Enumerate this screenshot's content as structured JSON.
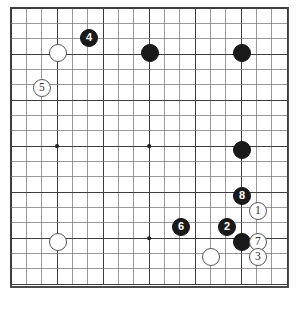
{
  "diagram": {
    "caption": "",
    "board": {
      "columns": 18,
      "rows": 18,
      "origin_x": 11,
      "origin_y": 8,
      "spacing": 15.35,
      "line_color": "#6e6e6e",
      "major_line_color": "#3c3c3c",
      "border_color": "#4a4a4a",
      "background_color": "#ffffff"
    },
    "star_points": [
      {
        "col": 3,
        "row": 9
      },
      {
        "col": 9,
        "row": 9
      },
      {
        "col": 9,
        "row": 15
      }
    ],
    "colors": {
      "black_stone": "#1a1a1a",
      "white_stone": "#ffffff",
      "white_stone_border": "#585858",
      "black_label": "#ffffff",
      "white_label": "#303030"
    },
    "legend": {
      "black_name": "Black",
      "white_name": "White"
    },
    "stones": [
      {
        "id": "w-a",
        "color": "white",
        "label": "",
        "col": 3,
        "row": 3,
        "cx": 58,
        "cy": 53
      },
      {
        "id": "b-4",
        "color": "black",
        "label": "4",
        "col": 5,
        "row": 2,
        "cx": 89,
        "cy": 38
      },
      {
        "id": "b-b",
        "color": "black",
        "label": "",
        "col": 9,
        "row": 3,
        "cx": 150,
        "cy": 53
      },
      {
        "id": "b-c",
        "color": "black",
        "label": "",
        "col": 15,
        "row": 3,
        "cx": 242,
        "cy": 53
      },
      {
        "id": "w-5",
        "color": "white",
        "label": "5",
        "col": 2,
        "row": 5,
        "cx": 42,
        "cy": 88
      },
      {
        "id": "b-d",
        "color": "black",
        "label": "",
        "col": 15,
        "row": 9,
        "cx": 242,
        "cy": 150
      },
      {
        "id": "b-8",
        "color": "black",
        "label": "8",
        "col": 15,
        "row": 12,
        "cx": 242,
        "cy": 196
      },
      {
        "id": "w-1",
        "color": "white",
        "label": "1",
        "col": 16,
        "row": 13,
        "cx": 258,
        "cy": 211
      },
      {
        "id": "b-6",
        "color": "black",
        "label": "6",
        "col": 11,
        "row": 14,
        "cx": 181,
        "cy": 227
      },
      {
        "id": "b-2",
        "color": "black",
        "label": "2",
        "col": 14,
        "row": 14,
        "cx": 227,
        "cy": 227
      },
      {
        "id": "w-e",
        "color": "white",
        "label": "",
        "col": 3,
        "row": 15,
        "cx": 58,
        "cy": 242
      },
      {
        "id": "b-f",
        "color": "black",
        "label": "",
        "col": 15,
        "row": 15,
        "cx": 242,
        "cy": 242
      },
      {
        "id": "w-7",
        "color": "white",
        "label": "7",
        "col": 16,
        "row": 15,
        "cx": 258,
        "cy": 242
      },
      {
        "id": "w-g",
        "color": "white",
        "label": "",
        "col": 13,
        "row": 16,
        "cx": 211,
        "cy": 257
      },
      {
        "id": "w-3",
        "color": "white",
        "label": "3",
        "col": 16,
        "row": 16,
        "cx": 258,
        "cy": 257
      }
    ]
  }
}
